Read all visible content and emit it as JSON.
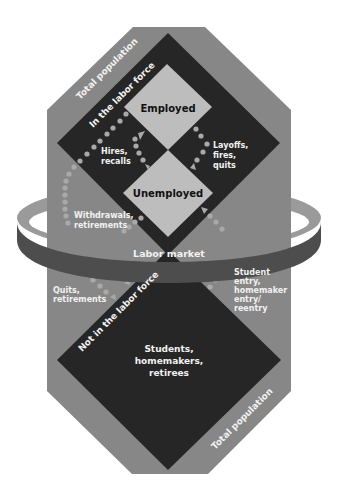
{
  "diagram": {
    "colors": {
      "octagon": "#878787",
      "dark_diamond": "#262626",
      "light_diamond": "#bdbdbd",
      "dots": "#a9a9a9",
      "ring_front": "#4d4d4d",
      "ring_top": "#9a9a9a"
    },
    "outer": {
      "label_top": "Total population",
      "label_bottom": "Total population"
    },
    "in_labor_force": {
      "label": "In the labor force",
      "employed": "Employed",
      "unemployed": "Unemployed"
    },
    "not_in_labor_force": {
      "label": "Not in the labor force",
      "contents": [
        "Students,",
        "homemakers,",
        "retirees"
      ]
    },
    "ring": {
      "label": "Labor market"
    },
    "flows": {
      "hires": [
        "Hires,",
        "recalls"
      ],
      "layoffs": [
        "Layoffs,",
        "fires,",
        "quits"
      ],
      "withdrawals": [
        "Withdrawals,",
        "retirements"
      ],
      "quits": [
        "Quits,",
        "retirements"
      ],
      "entry": [
        "Student",
        "entry,",
        "homemaker",
        "entry/",
        "reentry"
      ]
    }
  }
}
